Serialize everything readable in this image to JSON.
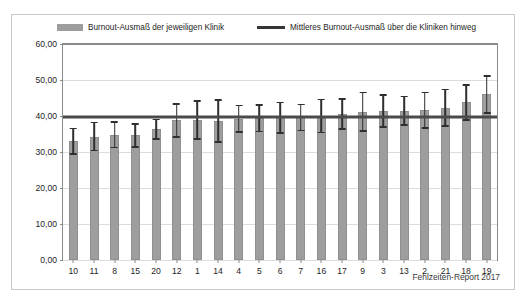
{
  "figure": {
    "source_note": "Fehlzeiten-Report 2017"
  },
  "legend": {
    "items": [
      {
        "label": "Burnout-Ausmaß der jeweiligen Klinik",
        "marker": "bar-swatch-icon",
        "color": "#9d9d9d"
      },
      {
        "label": "Mittleres Burnout-Ausmaß über die Kliniken hinweg",
        "marker": "mean-line-icon",
        "color": "#353535"
      }
    ]
  },
  "chart_data": {
    "type": "bar",
    "title": "",
    "subtitle": "",
    "xlabel": "",
    "ylabel": "",
    "ylim": [
      0,
      60
    ],
    "yticks": [
      0,
      10,
      20,
      30,
      40,
      50,
      60
    ],
    "ytick_labels": [
      "0,00",
      "10,00",
      "20,00",
      "30,00",
      "40,00",
      "50,00",
      "60,00"
    ],
    "grid": true,
    "legend_position": "top",
    "categories": [
      "10",
      "11",
      "8",
      "15",
      "20",
      "12",
      "1",
      "14",
      "4",
      "5",
      "6",
      "7",
      "16",
      "17",
      "9",
      "3",
      "13",
      "2",
      "21",
      "18",
      "19"
    ],
    "values": [
      33.0,
      34.3,
      34.8,
      34.6,
      36.3,
      38.8,
      38.9,
      38.6,
      39.2,
      39.4,
      39.5,
      39.6,
      40.0,
      40.6,
      41.2,
      41.4,
      41.5,
      41.6,
      42.3,
      43.8,
      46.0
    ],
    "error_low": [
      29.2,
      30.2,
      31.0,
      31.2,
      33.4,
      34.0,
      33.4,
      32.6,
      35.3,
      35.5,
      35.0,
      35.8,
      35.2,
      36.2,
      35.6,
      36.8,
      37.3,
      36.5,
      37.0,
      38.7,
      40.6
    ],
    "error_high": [
      36.8,
      38.4,
      38.6,
      38.0,
      39.2,
      43.6,
      44.4,
      44.6,
      43.1,
      43.3,
      44.0,
      43.4,
      44.8,
      45.0,
      46.8,
      46.0,
      45.7,
      46.7,
      47.6,
      48.9,
      51.4
    ],
    "mean_line": {
      "value": 39.7,
      "label": "Mittleres Burnout-Ausmaß über die Kliniken hinweg",
      "color": "#4a4a4a"
    },
    "series": [
      {
        "name": "Burnout-Ausmaß der jeweiligen Klinik",
        "color": "#9e9e9e",
        "values": [
          33.0,
          34.3,
          34.8,
          34.6,
          36.3,
          38.8,
          38.9,
          38.6,
          39.2,
          39.4,
          39.5,
          39.6,
          40.0,
          40.6,
          41.2,
          41.4,
          41.5,
          41.6,
          42.3,
          43.8,
          46.0
        ]
      }
    ]
  }
}
